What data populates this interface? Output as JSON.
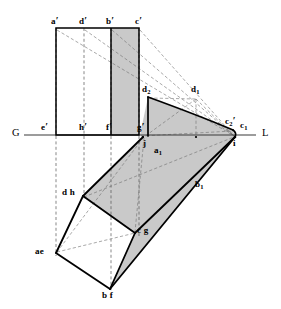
{
  "figure": {
    "ground_line": {
      "left_label": "G",
      "right_label": "L",
      "y": 135,
      "x_start": 24,
      "x_end": 256
    },
    "colors": {
      "stroke": "#000000",
      "shade_fill": "#c9c9c9",
      "shade_fill_light": "#d6d6d6",
      "white_fill": "#ffffff",
      "dash_stroke": "#555555",
      "thin_stroke": "#6a6a6a",
      "background": "#ffffff"
    }
  },
  "labels": {
    "ground_left": "G",
    "ground_right": "L",
    "front_top": [
      {
        "id": "a-prime",
        "text": "a",
        "prime": "′",
        "x": 51,
        "y": 19
      },
      {
        "id": "d-prime",
        "text": "d",
        "prime": "′",
        "x": 79,
        "y": 19
      },
      {
        "id": "b-prime",
        "text": "b",
        "prime": "′",
        "x": 106,
        "y": 19
      },
      {
        "id": "c-prime",
        "text": "c",
        "prime": "′",
        "x": 135,
        "y": 19
      }
    ],
    "front_base": [
      {
        "id": "e-prime",
        "text": "e",
        "prime": "′",
        "x": 41,
        "y": 123
      },
      {
        "id": "h-prime",
        "text": "h",
        "prime": "′",
        "x": 81,
        "y": 123
      },
      {
        "id": "f-prime",
        "text": "f",
        "prime": "′",
        "x": 108,
        "y": 123
      },
      {
        "id": "g-prime",
        "text": "g",
        "prime": "′",
        "x": 139,
        "y": 123
      }
    ],
    "auxiliary": [
      {
        "id": "d2",
        "text": "d",
        "sub": "2",
        "x": 143,
        "y": 88
      },
      {
        "id": "d1",
        "text": "d",
        "sub": "1",
        "x": 192,
        "y": 88
      },
      {
        "id": "c2-prime",
        "text": "c",
        "sub": "2",
        "prime": "′",
        "x": 226,
        "y": 119
      },
      {
        "id": "c1",
        "text": "c",
        "sub": "1",
        "x": 241,
        "y": 123
      },
      {
        "id": "i",
        "text": "i",
        "x": 233,
        "y": 140
      },
      {
        "id": "j",
        "text": "j",
        "x": 144,
        "y": 140
      },
      {
        "id": "a1",
        "text": "a",
        "sub": "1",
        "x": 155,
        "y": 148
      },
      {
        "id": "b1",
        "text": "b",
        "sub": "1",
        "x": 196,
        "y": 183
      }
    ],
    "plan": [
      {
        "id": "dh",
        "text": "d h",
        "x": 62,
        "y": 190
      },
      {
        "id": "cg",
        "text": "c g",
        "x": 137,
        "y": 227
      },
      {
        "id": "ae",
        "text": "ae",
        "x": 36,
        "y": 248
      },
      {
        "id": "bf",
        "text": "b f",
        "x": 103,
        "y": 292
      }
    ]
  },
  "geometry": {
    "front_rect": {
      "a_prime": [
        56,
        28
      ],
      "d_prime": [
        84,
        28
      ],
      "b_prime": [
        111,
        28
      ],
      "c_prime": [
        139,
        28
      ],
      "e_prime": [
        56,
        135
      ],
      "h_prime": [
        84,
        135
      ],
      "f_prime": [
        111,
        135
      ],
      "g_prime": [
        139,
        135
      ]
    },
    "aux_triangle": {
      "d2": [
        148,
        97
      ],
      "g_prime": [
        139,
        135
      ],
      "c2_prime": [
        233,
        130
      ],
      "i": [
        235,
        137
      ],
      "j": [
        143,
        137
      ],
      "d1": [
        196,
        97
      ]
    },
    "plan_prism": {
      "ae": [
        56,
        253
      ],
      "dh": [
        83,
        196
      ],
      "bf": [
        110,
        289
      ],
      "cg": [
        135,
        233
      ],
      "i": [
        235,
        137
      ],
      "j": [
        143,
        137
      ]
    },
    "projectors_x": [
      56,
      84,
      111,
      139
    ]
  }
}
